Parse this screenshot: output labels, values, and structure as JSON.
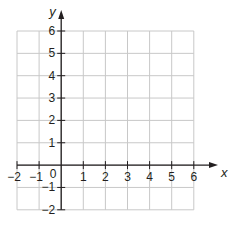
{
  "chart_data": {
    "type": "coordinate-grid",
    "title": "",
    "xlabel": "x",
    "ylabel": "y",
    "xlim": [
      -2,
      6
    ],
    "ylim": [
      -2,
      6
    ],
    "x_ticks": [
      "−2",
      "−1",
      "1",
      "2",
      "3",
      "4",
      "5",
      "6"
    ],
    "y_ticks": [
      "6",
      "5",
      "4",
      "3",
      "2",
      "1",
      "−1",
      "−2"
    ],
    "origin_label": "0",
    "grid": true,
    "data_points": []
  },
  "labels": {
    "x_axis": "x",
    "y_axis": "y",
    "origin": "0",
    "x_ticks": [
      {
        "v": -2,
        "t": "−2"
      },
      {
        "v": -1,
        "t": "−1"
      },
      {
        "v": 1,
        "t": "1"
      },
      {
        "v": 2,
        "t": "2"
      },
      {
        "v": 3,
        "t": "3"
      },
      {
        "v": 4,
        "t": "4"
      },
      {
        "v": 5,
        "t": "5"
      },
      {
        "v": 6,
        "t": "6"
      }
    ],
    "y_ticks": [
      {
        "v": 6,
        "t": "6"
      },
      {
        "v": 5,
        "t": "5"
      },
      {
        "v": 4,
        "t": "4"
      },
      {
        "v": 3,
        "t": "3"
      },
      {
        "v": 2,
        "t": "2"
      },
      {
        "v": 1,
        "t": "1"
      },
      {
        "v": -1,
        "t": "−1"
      },
      {
        "v": -2,
        "t": "−2"
      }
    ]
  },
  "colors": {
    "grid": "#c8c8c8",
    "axis": "#231f20",
    "text": "#231f20"
  }
}
